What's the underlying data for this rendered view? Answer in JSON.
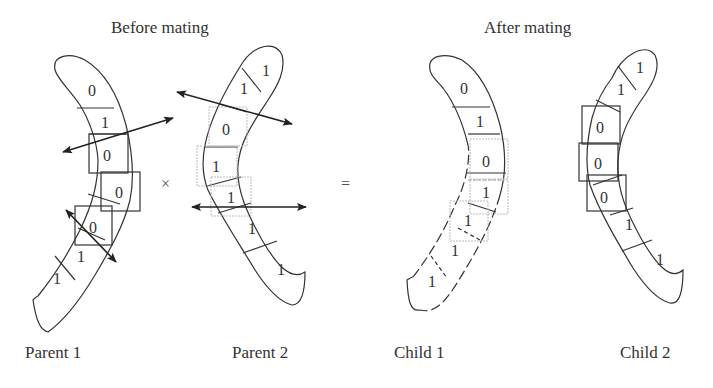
{
  "headings": {
    "before": "Before mating",
    "after": "After mating"
  },
  "operators": {
    "cross": "×",
    "equals": "="
  },
  "captions": {
    "parent1": "Parent 1",
    "parent2": "Parent 2",
    "child1": "Child 1",
    "child2": "Child 2"
  },
  "chromosomes": {
    "parent1": {
      "genes": [
        "0",
        "1",
        "0",
        "0",
        "0",
        "1",
        "1"
      ]
    },
    "parent2": {
      "genes": [
        "1",
        "1",
        "0",
        "1",
        "1",
        "1",
        "1"
      ]
    },
    "child1": {
      "genes": [
        "0",
        "1",
        "0",
        "1",
        "1",
        "1",
        "1"
      ]
    },
    "child2": {
      "genes": [
        "1",
        "1",
        "0",
        "0",
        "0",
        "1",
        "1"
      ]
    }
  },
  "colors": {
    "stroke": "#333333",
    "dashed_box": "#bbbbbb",
    "text": "#333333"
  }
}
